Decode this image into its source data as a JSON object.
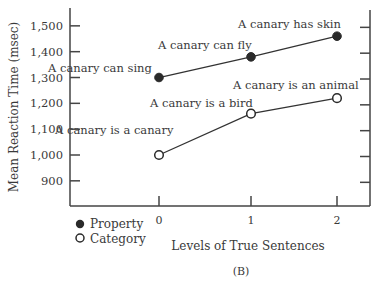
{
  "chart_data": {
    "type": "line",
    "title": "",
    "xlabel": "Levels of True Sentences",
    "ylabel": "Mean Reaction Time (msec)",
    "caption": "(B)",
    "x": [
      0,
      1,
      2
    ],
    "x_tick_labels": [
      "0",
      "1",
      "2"
    ],
    "y_ticks": [
      900,
      1000,
      1100,
      1200,
      1300,
      1400,
      1500
    ],
    "y_tick_labels": [
      "900",
      "1,000",
      "1,100",
      "1,200",
      "1,300",
      "1,400",
      "1,500"
    ],
    "ylim": [
      800,
      1570
    ],
    "grid": false,
    "legend_position": "bottom-left",
    "series": [
      {
        "name": "Property",
        "marker": "filled-circle",
        "values": [
          1300,
          1380,
          1460
        ],
        "annotations": [
          "A canary can sing",
          "A canary can fly",
          "A canary has skin"
        ]
      },
      {
        "name": "Category",
        "marker": "open-circle",
        "values": [
          1000,
          1160,
          1220
        ],
        "annotations": [
          "A canary is a canary",
          "A canary is a bird",
          "A canary is an animal"
        ]
      }
    ]
  },
  "legend": {
    "items": [
      {
        "label": "Property",
        "icon": "filled-circle-icon"
      },
      {
        "label": "Category",
        "icon": "open-circle-icon"
      }
    ]
  },
  "colors": {
    "ink": "#3a3a3a",
    "marker_fill": "#2a2a2a",
    "background": "#ffffff"
  }
}
